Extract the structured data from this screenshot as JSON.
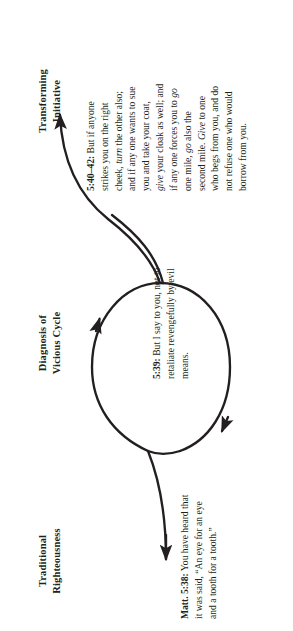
{
  "figure": {
    "line_color": "#231f20",
    "background_color": "#ffffff"
  },
  "stages": [
    {
      "id": "traditional-righteousness",
      "heading": "Traditional\nRighteousness",
      "caption_ref": "Matt. 5:38:",
      "caption_text": " You have heard that it was said, “An eye for an eye and a tooth for a tooth.”",
      "caption_lines": [
        "Matt. 5:38: You have heard",
        "that it was said, “An eye for",
        "an eye and a tooth for a tooth.”"
      ]
    },
    {
      "id": "diagnosis-of-vicious-cycle",
      "heading": "Diagnosis of\nVicious Cycle",
      "caption_ref": "5:39:",
      "caption_text": " But I say to you, not to retaliate revengefully by evil means.",
      "caption_lines": [
        "5:39: But I say to you,",
        "not to retaliate revengefully",
        "by evil means."
      ]
    },
    {
      "id": "transforming-initiative",
      "heading": "Transforming\nInitiative",
      "caption_ref": "5:40–42:",
      "caption_text": " But if anyone strikes you on the right cheek, turn the other also; and if any one wants to sue you and take your coat, give your cloak as well; and if any one forces you to go one mile, go also the second mile. Give to one who begs from you, and do not refuse one who would borrow from you.",
      "caption_lines": [
        "5:40–42: But if anyone",
        "strikes you on the right",
        "cheek, turn the other",
        "also; and if any one",
        "wants to sue you and",
        "take your coat, give your",
        "cloak as well; and if any",
        "one forces you to go",
        "one mile, go also the",
        "second mile. Give to",
        "one who begs from you,",
        "and do not refuse one",
        "who would borrow",
        "from you."
      ],
      "italic_words": [
        "turn",
        "give",
        "go",
        "Give"
      ]
    }
  ],
  "arrows": [
    {
      "id": "entry-arrow",
      "label": "arrow into vicious cycle"
    },
    {
      "id": "cycle-arrow-upper",
      "label": "vicious cycle loop arrow"
    },
    {
      "id": "cycle-arrow-lower",
      "label": "vicious cycle return arrow"
    },
    {
      "id": "exit-arrow",
      "label": "arrow out to transforming initiative"
    }
  ]
}
